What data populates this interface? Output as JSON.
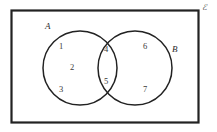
{
  "diagram": {
    "type": "venn-diagram",
    "universe": {
      "label": "ℰ",
      "description": "universal set rectangle"
    },
    "sets": [
      {
        "id": "A",
        "label": "A",
        "name": "left-set"
      },
      {
        "id": "B",
        "label": "B",
        "name": "right-set"
      }
    ],
    "regions": [
      {
        "id": "r1",
        "label": "1",
        "membership": "A only"
      },
      {
        "id": "r2",
        "label": "2",
        "membership": "A only"
      },
      {
        "id": "r3",
        "label": "3",
        "membership": "A only"
      },
      {
        "id": "r4",
        "label": "4",
        "membership": "A and B"
      },
      {
        "id": "r5",
        "label": "5",
        "membership": "A and B"
      },
      {
        "id": "r6",
        "label": "6",
        "membership": "B only"
      },
      {
        "id": "r7",
        "label": "7",
        "membership": "B only"
      }
    ],
    "colors": {
      "background": "#ffffff",
      "stroke": "#222222",
      "text": "#333333"
    }
  }
}
